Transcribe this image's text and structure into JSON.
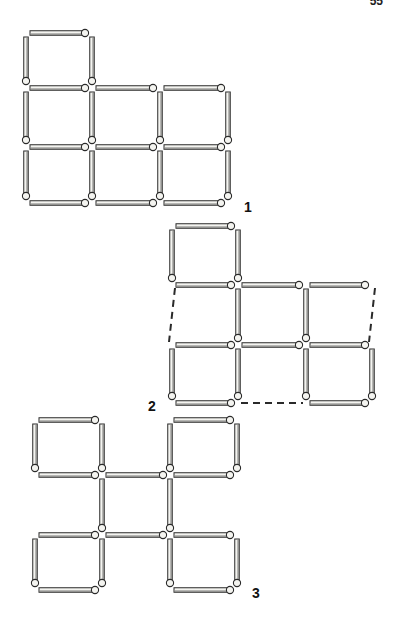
{
  "page": {
    "number": "55"
  },
  "figures": [
    {
      "label": "1",
      "label_pos": [
        244,
        209
      ],
      "description": "Matchstick arrangement: 7 squares (one square on top-left, 3x2 grid below)",
      "grid": {
        "xs": [
          26,
          92,
          160,
          228
        ],
        "ys": [
          33,
          88,
          147,
          203
        ]
      },
      "horizontal": [
        [
          0,
          0
        ],
        [
          0,
          1
        ],
        [
          1,
          1
        ],
        [
          2,
          1
        ],
        [
          0,
          2
        ],
        [
          1,
          2
        ],
        [
          2,
          2
        ],
        [
          0,
          3
        ],
        [
          1,
          3
        ],
        [
          2,
          3
        ]
      ],
      "vertical": [
        [
          0,
          0
        ],
        [
          1,
          0
        ],
        [
          0,
          1
        ],
        [
          1,
          1
        ],
        [
          2,
          1
        ],
        [
          3,
          1
        ],
        [
          0,
          2
        ],
        [
          1,
          2
        ],
        [
          2,
          2
        ],
        [
          3,
          2
        ]
      ],
      "dashed_h": [],
      "dashed_v": []
    },
    {
      "label": "2",
      "label_pos": [
        148,
        408
      ],
      "description": "Moves shown: dashed segments mark positions where matches were removed",
      "grid": {
        "xs": [
          172,
          238,
          306,
          372
        ],
        "ys": [
          226,
          285,
          345,
          403
        ]
      },
      "horizontal": [
        [
          0,
          0
        ],
        [
          0,
          1
        ],
        [
          1,
          1
        ],
        [
          2,
          1
        ],
        [
          0,
          2
        ],
        [
          1,
          2
        ],
        [
          2,
          2
        ],
        [
          0,
          3
        ],
        [
          2,
          3
        ]
      ],
      "vertical": [
        [
          0,
          0
        ],
        [
          1,
          0
        ],
        [
          1,
          1
        ],
        [
          2,
          1
        ],
        [
          0,
          2
        ],
        [
          1,
          2
        ],
        [
          2,
          2
        ],
        [
          3,
          2
        ]
      ],
      "dashed_h": [
        [
          1,
          3
        ]
      ],
      "dashed_v": [
        [
          0,
          1
        ],
        [
          3,
          1
        ]
      ]
    },
    {
      "label": "3",
      "label_pos": [
        252,
        595
      ],
      "description": "Result: four squares at corners joined by a central square",
      "grid": {
        "xs": [
          35,
          102,
          170,
          237
        ],
        "ys": [
          420,
          475,
          535,
          590
        ]
      },
      "horizontal": [
        [
          0,
          0
        ],
        [
          2,
          0
        ],
        [
          0,
          1
        ],
        [
          1,
          1
        ],
        [
          2,
          1
        ],
        [
          0,
          2
        ],
        [
          1,
          2
        ],
        [
          2,
          2
        ],
        [
          0,
          3
        ],
        [
          2,
          3
        ]
      ],
      "vertical": [
        [
          0,
          0
        ],
        [
          1,
          0
        ],
        [
          2,
          0
        ],
        [
          3,
          0
        ],
        [
          1,
          1
        ],
        [
          2,
          1
        ],
        [
          0,
          2
        ],
        [
          1,
          2
        ],
        [
          2,
          2
        ],
        [
          3,
          2
        ]
      ],
      "dashed_h": [],
      "dashed_v": []
    }
  ],
  "colors": {
    "ink": "#2a2a2a",
    "match_fill": "#f4f4f0",
    "paper": "#ffffff"
  }
}
